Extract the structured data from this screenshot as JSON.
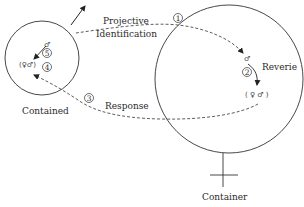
{
  "labels": {
    "projective": "Projective",
    "identification": "Identification",
    "reverie": "Reverie",
    "response": "Response",
    "contained": "Contained",
    "container": "Container"
  },
  "steps": [
    "1",
    "2",
    "3",
    "4",
    "5"
  ],
  "symbols": {
    "male": "♂",
    "pair": "(♀♂)",
    "pair_spaced": "( ♀ ♂ )"
  },
  "colors": {
    "line": "#333333",
    "text": "#2a2a2a"
  }
}
